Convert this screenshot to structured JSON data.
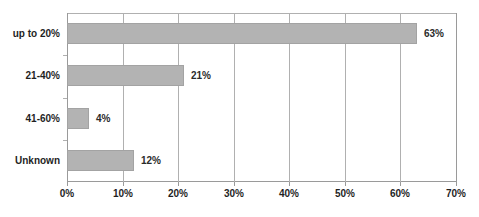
{
  "chart_data": {
    "type": "bar",
    "orientation": "horizontal",
    "title": "",
    "subtitle": "",
    "xlabel": "",
    "ylabel": "",
    "categories": [
      "up to 20%",
      "21-40%",
      "41-60%",
      "Unknown"
    ],
    "values": [
      63,
      21,
      4,
      12
    ],
    "data_labels": [
      "63%",
      "21%",
      "4%",
      "12%"
    ],
    "xlim": [
      0,
      70
    ],
    "xticks": [
      0,
      10,
      20,
      30,
      40,
      50,
      60,
      70
    ],
    "xtick_labels": [
      "0%",
      "10%",
      "20%",
      "30%",
      "40%",
      "50%",
      "60%",
      "70%"
    ],
    "grid": true,
    "grid_axis": "x",
    "legend": false,
    "legend_position": "none",
    "series": [
      {
        "name": "",
        "values": [
          63,
          21,
          4,
          12
        ]
      }
    ],
    "colors": {
      "bar_fill": "#b3b3b3",
      "bar_border": "#a3a3a3",
      "gridline": "#b0b0b0",
      "axis": "#9a9a9a",
      "text": "#1f1f1f",
      "value_text": "#2b2b2b",
      "background": "#ffffff"
    }
  }
}
